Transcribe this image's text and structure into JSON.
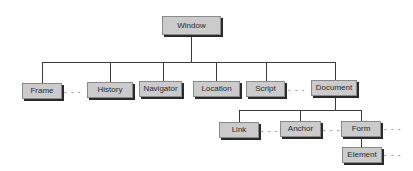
{
  "diagram": {
    "type": "hierarchy",
    "root": "Window",
    "ellipsis": "- - -",
    "nodes": {
      "window": "Window",
      "frame": "Frame",
      "history": "History",
      "navigator": "Navigator",
      "location": "Location",
      "script": "Script",
      "document": "Document",
      "link": "Link",
      "anchor": "Anchor",
      "form": "Form",
      "element": "Element"
    },
    "edges": [
      [
        "Window",
        "Frame"
      ],
      [
        "Window",
        "History"
      ],
      [
        "Window",
        "Navigator"
      ],
      [
        "Window",
        "Location"
      ],
      [
        "Window",
        "Script"
      ],
      [
        "Window",
        "Document"
      ],
      [
        "Document",
        "Link"
      ],
      [
        "Document",
        "Anchor"
      ],
      [
        "Document",
        "Form"
      ],
      [
        "Form",
        "Element"
      ]
    ],
    "nodes_with_more": [
      "Frame",
      "Script",
      "Link",
      "Anchor",
      "Form",
      "Element"
    ]
  }
}
